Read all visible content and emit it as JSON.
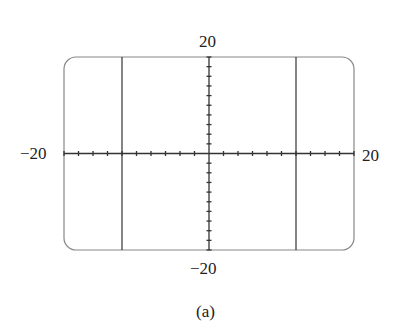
{
  "chart_data": {
    "type": "line",
    "title": "",
    "caption": "(a)",
    "xlim": [
      -20,
      20
    ],
    "ylim": [
      -20,
      20
    ],
    "x_tick_spacing": 2,
    "y_tick_spacing": 2,
    "grid": false,
    "series": [
      {
        "name": "vertical line x=-12",
        "x": [
          -12,
          -12
        ],
        "y": [
          -20,
          20
        ]
      },
      {
        "name": "vertical line x=12",
        "x": [
          12,
          12
        ],
        "y": [
          -20,
          20
        ]
      }
    ]
  },
  "labels": {
    "ymax": "20",
    "ymin": "−20",
    "xmin": "−20",
    "xmax": "20",
    "caption": "(a)"
  }
}
